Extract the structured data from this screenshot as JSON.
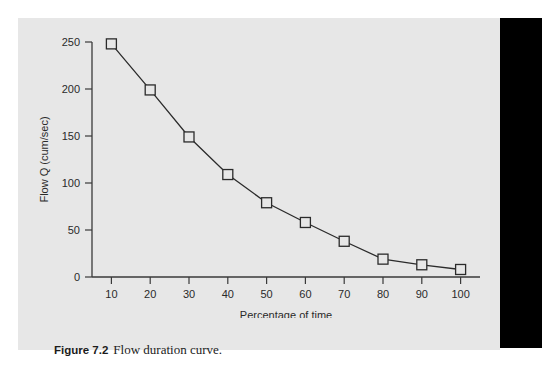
{
  "caption": {
    "label": "Figure 7.2",
    "text": "Flow duration curve."
  },
  "colors": {
    "panel_background": "#e7e7e7",
    "page_background": "#ffffff",
    "bar": "#000000",
    "line": "#2b2b2b",
    "axis": "#3a3a3a",
    "text": "#2a2a2a"
  },
  "chart_data": {
    "type": "line",
    "title": "",
    "xlabel": "Percentage of time",
    "ylabel": "Flow Q (cum/sec)",
    "x": [
      10,
      20,
      30,
      40,
      50,
      60,
      70,
      80,
      90,
      100
    ],
    "values": [
      248,
      199,
      149,
      109,
      79,
      58,
      38,
      19,
      13,
      8
    ],
    "xticks": [
      10,
      20,
      30,
      40,
      50,
      60,
      70,
      80,
      90,
      100
    ],
    "yticks": [
      0,
      50,
      100,
      150,
      200,
      250
    ],
    "xlim": [
      5,
      105
    ],
    "ylim": [
      0,
      250
    ],
    "grid": false,
    "legend": false,
    "marker": "open-square"
  }
}
